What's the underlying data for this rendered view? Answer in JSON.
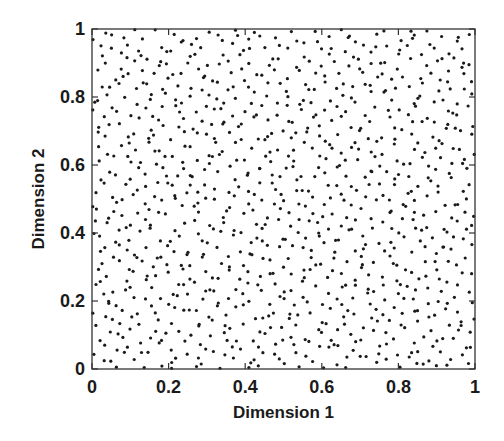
{
  "chart_data": {
    "type": "scatter",
    "title": "",
    "xlabel": "Dimension 1",
    "ylabel": "Dimension 2",
    "xlim": [
      0,
      1
    ],
    "ylim": [
      0,
      1
    ],
    "xticks": [
      0,
      0.2,
      0.4,
      0.6,
      0.8,
      1
    ],
    "yticks": [
      0,
      0.2,
      0.4,
      0.6,
      0.8,
      1
    ],
    "xtick_labels": [
      "0",
      "0.2",
      "0.4",
      "0.6",
      "0.8",
      "1"
    ],
    "ytick_labels": [
      "0",
      "0.2",
      "0.4",
      "0.6",
      "0.8",
      "1"
    ],
    "grid": false,
    "legend": null,
    "tick_direction": "in",
    "box": true,
    "series": [
      {
        "name": "samples",
        "marker": "dot",
        "marker_color": "#1a1a1a",
        "marker_diameter_px": 3.2,
        "approx_count": 1000,
        "distribution": "approximately uniform over [0,1] x [0,1] (space-filling / quasi-random sample set)",
        "note": "Individual point coordinates are too dense to transcribe; rendered with a seeded low-discrepancy sequence of equal count."
      }
    ]
  },
  "layout": {
    "plot_left": 92,
    "plot_top": 29,
    "plot_right": 475,
    "plot_bottom": 369,
    "axis_color": "#333333"
  }
}
